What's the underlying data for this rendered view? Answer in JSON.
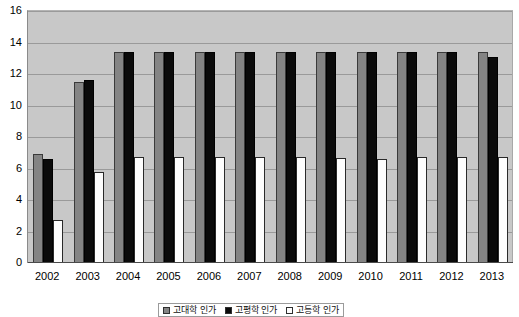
{
  "chart_data": {
    "type": "bar",
    "title": "",
    "xlabel": "",
    "ylabel": "",
    "ylim": [
      0,
      16
    ],
    "yticks": [
      0,
      2,
      4,
      6,
      8,
      10,
      12,
      14,
      16
    ],
    "grid": true,
    "legend_position": "bottom",
    "categories": [
      "2002",
      "2003",
      "2004",
      "2005",
      "2006",
      "2007",
      "2008",
      "2009",
      "2010",
      "2011",
      "2012",
      "2013"
    ],
    "series": [
      {
        "name": "고대학 인가",
        "color": "#848484",
        "values": [
          6.9,
          11.5,
          13.4,
          13.4,
          13.4,
          13.4,
          13.4,
          13.4,
          13.4,
          13.4,
          13.4,
          13.4
        ]
      },
      {
        "name": "고평학 인가",
        "color": "#0a0a0a",
        "values": [
          6.6,
          11.6,
          13.4,
          13.4,
          13.4,
          13.4,
          13.4,
          13.4,
          13.4,
          13.4,
          13.4,
          13.1
        ]
      },
      {
        "name": "고등학 인가",
        "color": "#fdfdfd",
        "values": [
          2.7,
          5.75,
          6.7,
          6.7,
          6.7,
          6.7,
          6.7,
          6.65,
          6.6,
          6.7,
          6.7,
          6.75
        ]
      }
    ]
  },
  "axis": {
    "y_labels": [
      "16",
      "14",
      "12",
      "10",
      "8",
      "6",
      "4",
      "2",
      "0"
    ]
  },
  "legend": {
    "items": [
      {
        "label": "고대학 인가",
        "swatch": "#848484"
      },
      {
        "label": "고평학 인가",
        "swatch": "#0a0a0a"
      },
      {
        "label": "고등학 인가",
        "swatch": "#fdfdfd"
      }
    ]
  }
}
